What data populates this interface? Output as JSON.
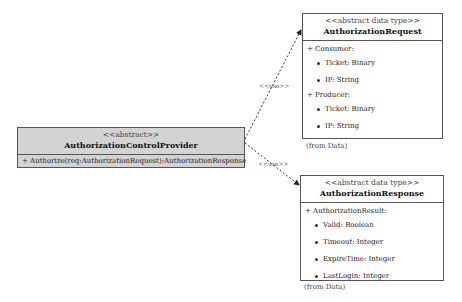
{
  "provider": {
    "stereotype": "<<abstract>>",
    "name": "AuthorizationControlProvider",
    "operations": [
      "+ Authorize(req:AuthorizationRequest):AuthorizationResponse"
    ]
  },
  "request": {
    "stereotype": "<<abstract data type>>",
    "name": "AuthorizationRequest",
    "groups": [
      {
        "label": "+ Consumer:",
        "items": [
          "Ticket: Binary",
          "IP: String"
        ]
      },
      {
        "label": "+ Producer:",
        "items": [
          "Ticket: Binary",
          "IP: String"
        ]
      }
    ],
    "package": "(from Data)"
  },
  "response": {
    "stereotype": "<<abstract data type>>",
    "name": "AuthorizationResponse",
    "groups": [
      {
        "label": "+ AuthorizationResult:",
        "items": [
          "Valid: Boolean",
          "Timeout: Integer",
          "ExpireTime: Integer",
          "LastLogin: Integer"
        ]
      }
    ],
    "package": "(from Data)"
  },
  "relations": [
    {
      "from": "AuthorizationControlProvider",
      "to": "AuthorizationRequest",
      "label": "<<use>>"
    },
    {
      "from": "AuthorizationControlProvider",
      "to": "AuthorizationResponse",
      "label": "<<use>>"
    }
  ]
}
